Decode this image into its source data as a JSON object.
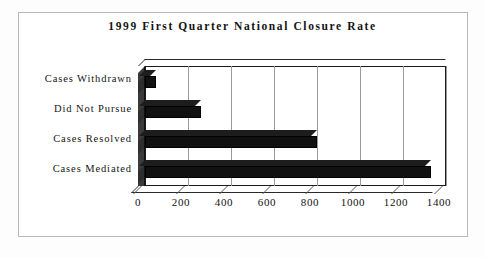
{
  "chart_data": {
    "type": "bar",
    "orientation": "horizontal",
    "title": "1999 First Quarter National Closure Rate",
    "xlabel": "",
    "ylabel": "",
    "categories": [
      "Cases Withdrawn",
      "Did Not Pursue",
      "Cases Resolved",
      "Cases Mediated"
    ],
    "values": [
      50,
      260,
      800,
      1330
    ],
    "xlim": [
      0,
      1400
    ],
    "xticks": [
      0,
      200,
      400,
      600,
      800,
      1000,
      1200,
      1400
    ],
    "xtick_labels": [
      "0",
      "200",
      "400",
      "600",
      "800",
      "1000",
      "1200",
      "1400"
    ],
    "grid": "vertical",
    "legend": "none",
    "style": "3d-bar",
    "bar_color": "#111111",
    "plot_background": "#ffffff",
    "axis_color": "#1b1b1b",
    "gridline_color": "#9a9a9a"
  },
  "figure": {
    "background": "#ffffff",
    "border_color": "#b8b8b8"
  }
}
